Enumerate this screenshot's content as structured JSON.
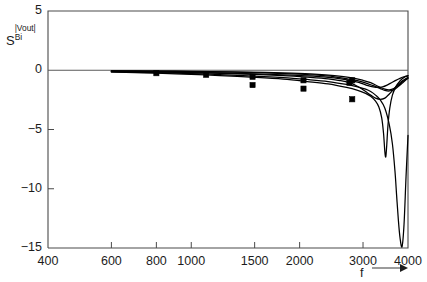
{
  "chart_data": {
    "type": "line",
    "title": "",
    "xlabel": "f",
    "ylabel": "S",
    "ylabel_superscript": "|Vout|",
    "ylabel_subscript": "Bi",
    "xscale": "log",
    "xlim": [
      400,
      4000
    ],
    "ylim": [
      -15,
      5
    ],
    "xticks": [
      400,
      600,
      800,
      1000,
      1500,
      2000,
      3000,
      4000
    ],
    "xticklabels": [
      "400",
      "600",
      "800",
      "1000",
      "1500",
      "2000",
      "3000",
      "4000"
    ],
    "yticks": [
      5,
      0,
      -5,
      -10,
      -15
    ],
    "yticklabels": [
      "5",
      "0",
      "-5",
      "-10",
      "-15"
    ],
    "grid": false,
    "legend": false,
    "xaxis_arrow": true,
    "series": [
      {
        "name": "curve-1",
        "x": [
          600,
          700,
          800,
          1000,
          1200,
          1500,
          1800,
          2100,
          2400,
          2700,
          2900,
          3050,
          3150,
          3250,
          3320,
          3380,
          3420,
          3450,
          3470,
          3490,
          3520,
          3560,
          3620,
          3700,
          3800,
          3900,
          4000
        ],
        "y": [
          -0.15,
          -0.2,
          -0.25,
          -0.35,
          -0.45,
          -0.6,
          -0.75,
          -0.95,
          -1.15,
          -1.45,
          -1.7,
          -1.95,
          -2.2,
          -2.6,
          -3.1,
          -4.0,
          -5.3,
          -6.9,
          -7.3,
          -6.4,
          -4.6,
          -3.2,
          -2.1,
          -1.4,
          -0.9,
          -0.6,
          -0.45
        ]
      },
      {
        "name": "curve-2",
        "x": [
          600,
          700,
          800,
          1000,
          1200,
          1500,
          1800,
          2100,
          2400,
          2700,
          2900,
          3050,
          3150,
          3250,
          3350,
          3450,
          3550,
          3620,
          3680,
          3720,
          3760,
          3800,
          3850,
          3900,
          3950,
          4000
        ],
        "y": [
          -0.12,
          -0.16,
          -0.2,
          -0.28,
          -0.36,
          -0.5,
          -0.62,
          -0.78,
          -0.95,
          -1.2,
          -1.4,
          -1.6,
          -1.8,
          -2.1,
          -2.5,
          -3.2,
          -4.6,
          -6.2,
          -8.5,
          -10.6,
          -12.6,
          -14.1,
          -14.9,
          -13.0,
          -9.0,
          -5.5
        ]
      },
      {
        "name": "curve-3",
        "x": [
          600,
          700,
          800,
          1000,
          1200,
          1500,
          1800,
          2100,
          2400,
          2600,
          2750,
          2850,
          2950,
          3050,
          3150,
          3250,
          3350,
          3450,
          3550,
          3650,
          3750,
          3850,
          3950,
          4000
        ],
        "y": [
          -0.1,
          -0.12,
          -0.15,
          -0.2,
          -0.26,
          -0.35,
          -0.45,
          -0.58,
          -0.72,
          -0.88,
          -1.05,
          -1.25,
          -1.5,
          -1.8,
          -2.1,
          -2.35,
          -2.45,
          -2.35,
          -2.0,
          -1.6,
          -1.2,
          -0.9,
          -0.7,
          -0.6
        ]
      },
      {
        "name": "curve-4",
        "x": [
          600,
          700,
          800,
          1000,
          1200,
          1500,
          1800,
          2100,
          2400,
          2600,
          2750,
          2900,
          3000,
          3100,
          3200,
          3300,
          3400,
          3500,
          3600,
          3700,
          3800,
          3900,
          4000
        ],
        "y": [
          -0.08,
          -0.1,
          -0.12,
          -0.17,
          -0.22,
          -0.3,
          -0.38,
          -0.48,
          -0.6,
          -0.72,
          -0.85,
          -1.0,
          -1.15,
          -1.3,
          -1.4,
          -1.45,
          -1.4,
          -1.25,
          -1.05,
          -0.85,
          -0.68,
          -0.55,
          -0.48
        ]
      },
      {
        "name": "curve-5",
        "x": [
          600,
          800,
          1000,
          1300,
          1600,
          1900,
          2200,
          2500,
          2800,
          3000,
          3150,
          3250,
          3350,
          3450,
          3550,
          3650,
          3750,
          3850,
          3950,
          4000
        ],
        "y": [
          -0.05,
          -0.07,
          -0.09,
          -0.13,
          -0.18,
          -0.24,
          -0.32,
          -0.45,
          -0.65,
          -0.85,
          -1.05,
          -1.25,
          -1.45,
          -1.6,
          -1.65,
          -1.55,
          -1.3,
          -1.0,
          -0.75,
          -0.65
        ]
      },
      {
        "name": "curve-6",
        "x": [
          600,
          800,
          1000,
          1300,
          1600,
          1900,
          2200,
          2500,
          2800,
          3000,
          3200,
          3350,
          3450,
          3550,
          3650,
          3750,
          3850,
          3950,
          4000
        ],
        "y": [
          -0.06,
          -0.08,
          -0.11,
          -0.16,
          -0.22,
          -0.3,
          -0.4,
          -0.55,
          -0.8,
          -1.0,
          -1.3,
          -1.55,
          -1.7,
          -1.75,
          -1.65,
          -1.4,
          -1.1,
          -0.8,
          -0.7
        ]
      }
    ],
    "markers": [
      {
        "x": 800,
        "y": -0.25
      },
      {
        "x": 1100,
        "y": -0.38
      },
      {
        "x": 1480,
        "y": -0.55
      },
      {
        "x": 1480,
        "y": -1.25
      },
      {
        "x": 2050,
        "y": -0.85
      },
      {
        "x": 2050,
        "y": -1.55
      },
      {
        "x": 2750,
        "y": -1.05
      },
      {
        "x": 2800,
        "y": -0.85
      },
      {
        "x": 2800,
        "y": -2.45
      }
    ]
  }
}
